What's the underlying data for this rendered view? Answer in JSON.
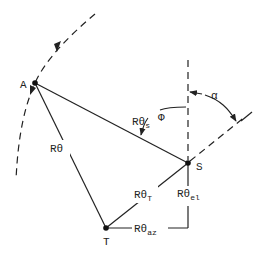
{
  "diagram": {
    "colors": {
      "ink": "#222222",
      "background": "#ffffff"
    },
    "points": [
      {
        "id": "A",
        "label": "A",
        "x": 35,
        "y": 83
      },
      {
        "id": "S",
        "label": "S",
        "x": 188,
        "y": 163
      },
      {
        "id": "T",
        "label": "T",
        "x": 106,
        "y": 228
      }
    ],
    "edges": [
      {
        "from": "A",
        "to": "S",
        "label_main": "Rθ",
        "label_sub": "s"
      },
      {
        "from": "A",
        "to": "T",
        "label_main": "Rθ",
        "label_sub": ""
      },
      {
        "from": "T",
        "to": "S",
        "label_main": "Rθ",
        "label_sub": "T"
      },
      {
        "from": "T",
        "to": "corner",
        "label_main": "Rθ",
        "label_sub": "az"
      },
      {
        "from": "corner",
        "to": "S",
        "label_main": "Rθ",
        "label_sub": "el"
      }
    ],
    "angles": [
      {
        "name": "phi",
        "label": "Φ"
      },
      {
        "name": "alpha",
        "label": "α"
      }
    ],
    "labels": {
      "A": "A",
      "S": "S",
      "T": "T",
      "R_theta_s_main": "Rθ",
      "R_theta_s_sub": "s",
      "R_theta_main": "Rθ",
      "R_theta_T_main": "Rθ",
      "R_theta_T_sub": "T",
      "R_theta_az_main": "Rθ",
      "R_theta_az_sub": "az",
      "R_theta_el_main": "Rθ",
      "R_theta_el_sub": "el",
      "phi": "Φ",
      "alpha": "α"
    }
  }
}
